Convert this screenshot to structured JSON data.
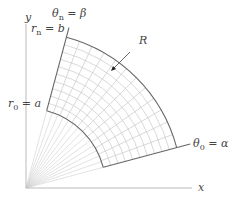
{
  "diagram": {
    "axes": {
      "x_label": "x",
      "y_label": "y"
    },
    "labels": {
      "theta_n": "θ",
      "theta_n_sub": "n",
      "theta_n_rhs": " = β",
      "r_n": "r",
      "r_n_sub": "n",
      "r_n_rhs": " = b",
      "r_0": "r",
      "r_0_sub": "0",
      "r_0_rhs": " = a",
      "theta_0": "θ",
      "theta_0_sub": "0",
      "theta_0_rhs": " = α",
      "region": "R"
    },
    "geometry": {
      "origin": [
        26,
        188
      ],
      "alpha_deg": 15,
      "beta_deg": 75,
      "inner_radius_px": 80,
      "outer_radius_px": 156,
      "radial_divisions": 10,
      "angular_divisions": 12,
      "fan_rays": 14
    },
    "colors": {
      "axis": "#bbbbbb",
      "boundary": "#666666",
      "grid": "#c8c8c8",
      "fan": "#cfcfcf",
      "text": "#444444"
    }
  }
}
